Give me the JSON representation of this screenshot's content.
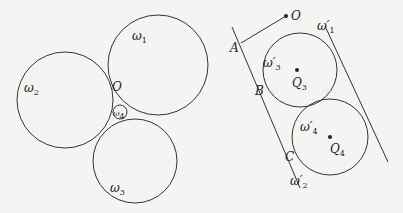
{
  "figure_left": {
    "circles": [
      {
        "id": "omega1",
        "cx": 158,
        "cy": 65,
        "r": 50,
        "label": "ω",
        "sub": "1",
        "lx": 132,
        "ly": 40
      },
      {
        "id": "omega2",
        "cx": 65,
        "cy": 100,
        "r": 48,
        "label": "ω",
        "sub": "2",
        "lx": 24,
        "ly": 92
      },
      {
        "id": "omega3",
        "cx": 135,
        "cy": 161,
        "r": 42,
        "label": "ω",
        "sub": "3",
        "lx": 110,
        "ly": 192
      },
      {
        "id": "omega4",
        "cx": 120,
        "cy": 112,
        "r": 7,
        "label": "ω",
        "sub": "4",
        "lx": 113,
        "ly": 116
      }
    ],
    "point_O": {
      "label": "O",
      "x": 112,
      "y": 91
    }
  },
  "figure_right": {
    "point_O": {
      "label": "O",
      "x": 286,
      "y": 16,
      "lx": 291,
      "ly": 20
    },
    "segment_OA": {
      "x1": 286,
      "y1": 16,
      "x2": 241,
      "y2": 43
    },
    "line_left": {
      "x1": 232,
      "y1": 27,
      "x2": 300,
      "y2": 188
    },
    "line_right": {
      "x1": 325,
      "y1": 26,
      "x2": 388,
      "y2": 162
    },
    "circles": [
      {
        "id": "omega3p",
        "cx": 300,
        "cy": 70,
        "r": 37,
        "label": "ω′",
        "sub": "3",
        "lx": 263,
        "ly": 67
      },
      {
        "id": "omega4p",
        "cx": 330,
        "cy": 137,
        "r": 38,
        "label": "ω′",
        "sub": "4",
        "lx": 300,
        "ly": 131
      }
    ],
    "centers": [
      {
        "label": "Q",
        "sub": "3",
        "x": 297,
        "y": 70,
        "lx": 292,
        "ly": 87
      },
      {
        "label": "Q",
        "sub": "4",
        "x": 330,
        "y": 137,
        "lx": 330,
        "ly": 153
      }
    ],
    "labels": [
      {
        "text": "A",
        "x": 230,
        "y": 52
      },
      {
        "text": "B",
        "x": 255,
        "y": 95
      },
      {
        "text": "C",
        "x": 285,
        "y": 161
      }
    ],
    "line_labels": [
      {
        "text": "ω′",
        "sub": "1",
        "x": 317,
        "y": 30
      },
      {
        "text": "ω′",
        "sub": "2",
        "x": 290,
        "y": 185
      }
    ]
  }
}
